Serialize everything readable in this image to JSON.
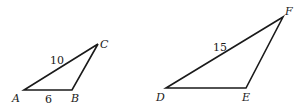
{
  "figure": {
    "triangles": [
      {
        "name": "ABC",
        "vertices": {
          "A": "A",
          "B": "B",
          "C": "C"
        },
        "sides": {
          "AC": "10",
          "AB": "6"
        }
      },
      {
        "name": "DEF",
        "vertices": {
          "D": "D",
          "E": "E",
          "F": "F"
        },
        "sides": {
          "DF": "15"
        }
      }
    ]
  }
}
